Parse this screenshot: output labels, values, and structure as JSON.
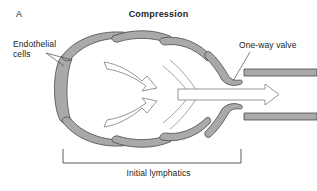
{
  "figure": {
    "panel_letter": "A",
    "title": "Compression",
    "background_color": "#ffffff",
    "wall_fill_color": "#a9a9a9",
    "wall_stroke_color": "#4a4a4a",
    "arrow_fill_color": "#ffffff",
    "arrow_stroke_color": "#8a8a8a",
    "text_color": "#1c1c1c",
    "width": 317,
    "height": 191
  },
  "labels": {
    "endothelial_cells": "Endothelial\ncells",
    "one_way_valve": "One-way valve",
    "initial_lymphatics": "Initial lymphatics"
  },
  "diagram": {
    "structures": [
      "initial lymphatic bulb",
      "overlapping endothelial cell flaps",
      "one-way valve leaflets",
      "collecting lymphatic vessel"
    ],
    "flow_arrows": [
      "upper inflow arrow",
      "lower inflow arrow",
      "central outflow arrow"
    ],
    "flow_direction": "left to right"
  }
}
